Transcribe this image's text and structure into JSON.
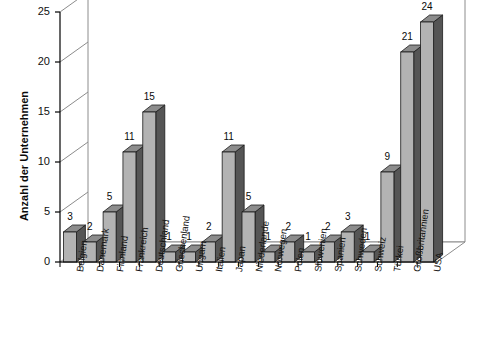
{
  "chart_data": {
    "type": "bar",
    "title": "",
    "subtitle": "",
    "xlabel": "",
    "ylabel": "Anzahl der Unternehmen",
    "ylim": [
      0,
      25
    ],
    "yticks": [
      0,
      5,
      10,
      15,
      20,
      25
    ],
    "grid": true,
    "legend": null,
    "style": "3d-column",
    "categories": [
      "Belgien",
      "Dänemark",
      "Finnland",
      "Frankreich",
      "Deutschland",
      "Griechenland",
      "Ungarn",
      "Italien",
      "Japan",
      "Niederlande",
      "Norwegen",
      "Polen",
      "Slowenien",
      "Spanien",
      "Schweden",
      "Schweiz",
      "Türkei",
      "Großbritannien",
      "USA"
    ],
    "values": [
      3,
      2,
      5,
      11,
      15,
      1,
      1,
      2,
      11,
      5,
      1,
      2,
      1,
      2,
      3,
      1,
      9,
      21,
      24
    ],
    "value_labels": [
      "3",
      "2",
      "5",
      "11",
      "15",
      "1",
      "1",
      "2",
      "11",
      "5",
      "1",
      "2",
      "1",
      "2",
      "3",
      "1",
      "9",
      "21",
      "24"
    ],
    "colors": {
      "bar_front": "#b3b3b3",
      "bar_side": "#555555",
      "bar_top": "#8c8c8c",
      "bar_outline": "#1a1a1a",
      "grid": "#8c8c8c",
      "axis": "#000000",
      "background": "#ffffff",
      "text": "#0a0a0a"
    }
  },
  "axis": {
    "y_title": "Anzahl der Unternehmen",
    "y_tick_labels": [
      "0",
      "5",
      "10",
      "15",
      "20",
      "25"
    ]
  }
}
